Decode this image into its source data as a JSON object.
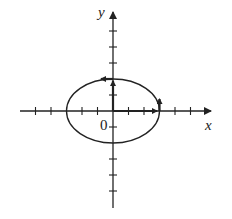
{
  "diagram": {
    "x_axis_label": "x",
    "y_axis_label": "y",
    "origin_label": "0",
    "colors": {
      "stroke": "#222222",
      "background": "#ffffff"
    },
    "origin_px": [
      113,
      111
    ],
    "tick_spacing_px": 15.5,
    "x_ticks": [
      -6,
      -5,
      -4,
      -3,
      -2,
      -1,
      1,
      2,
      3,
      4,
      5,
      6,
      7
    ],
    "y_ticks": [
      -6,
      -5,
      -4,
      -3,
      -2,
      -1,
      1,
      2,
      3,
      4,
      5,
      6
    ],
    "ellipse": {
      "center": [
        0,
        0
      ],
      "semi_major_x": 3,
      "semi_minor_y": 2,
      "orientation": "counterclockwise"
    },
    "vectors": [
      {
        "name": "position-vector",
        "from": [
          0,
          0
        ],
        "to": [
          3,
          0
        ]
      },
      {
        "name": "velocity-vector-at-x",
        "from": [
          3,
          0
        ],
        "to": [
          3,
          0.6
        ]
      },
      {
        "name": "position-vector-y",
        "from": [
          0,
          0
        ],
        "to": [
          0,
          2
        ]
      },
      {
        "name": "velocity-vector-at-y",
        "from": [
          0,
          2
        ],
        "to": [
          -0.7,
          2
        ]
      }
    ]
  }
}
